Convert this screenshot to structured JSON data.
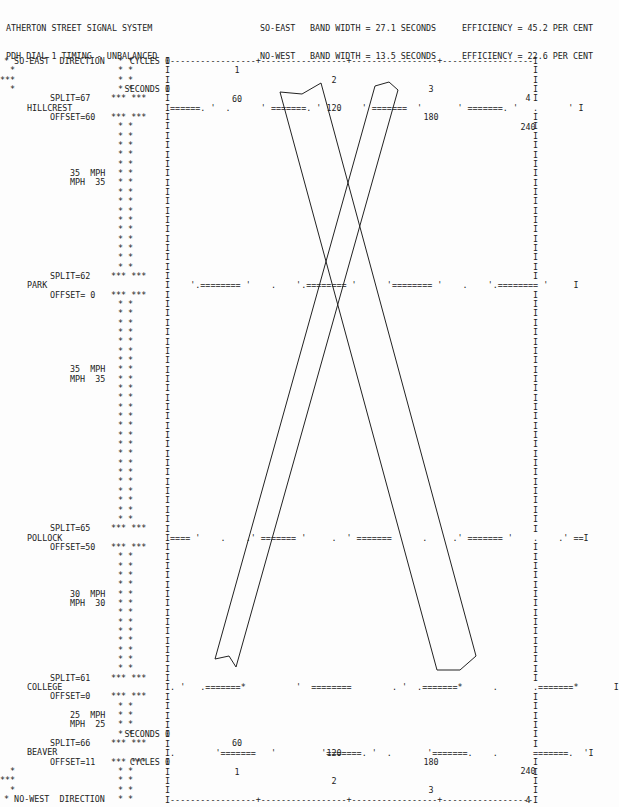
{
  "header": {
    "title_line1": "ATHERTON STREET SIGNAL SYSTEM",
    "title_line2": "PDH DIAL 1 TIMING - UNBALANCED",
    "so_east": {
      "direction": "SO-EAST",
      "band": "BAND WIDTH = 27.1 SECONDS",
      "efficiency": "EFFICIENCY = 45.2 PER CENT"
    },
    "no_west": {
      "direction": "NO-WEST",
      "band": "BAND WIDTH = 13.5 SECONDS",
      "efficiency": "EFFICIENCY = 22.6 PER CENT"
    }
  },
  "axis": {
    "cycles_label": "CYCLES 0",
    "seconds_label": "SECONDS 0",
    "cycles": [
      "1",
      "2",
      "3",
      "4"
    ],
    "seconds": [
      "60",
      "120",
      "180",
      "240"
    ]
  },
  "directions": {
    "top": "* SO-EAST  DIRECTION",
    "bottom": "* NO-WEST  DIRECTION"
  },
  "intersections": [
    {
      "name": "HILLCREST",
      "split": "SPLIT=67",
      "offset": "OFFSET=60",
      "pattern": "I======. '  .      ' =======. '   .    ' =======  '       ' =======. '   .      ' I"
    },
    {
      "name": "PARK",
      "split": "SPLIT=62",
      "offset": "OFFSET= 0",
      "pattern": "I    '.======== '    .    '.======== '      '======== '    .    '.======== '     I"
    },
    {
      "name": "POLLOCK",
      "split": "SPLIT=65",
      "offset": "OFFSET=50",
      "pattern": "I==== '    .    .' ======= '     .  ' =======      .     .' ======= '    .    .' ==I"
    },
    {
      "name": "COLLEGE",
      "split": "SPLIT=61",
      "offset": "OFFSET=0",
      "pattern": "I. '   .=======*          '  ========        . '  .=======*      .       .=======*       I"
    },
    {
      "name": "BEAVER",
      "split": "SPLIT=66",
      "offset": "OFFSET=11",
      "pattern": "I.        '=======   '         '=======. '  .       '=======.    .       =======.  'I"
    }
  ],
  "speeds": [
    {
      "se": "35  MPH",
      "nw": "MPH  35"
    },
    {
      "se": "35  MPH",
      "nw": "MPH  35"
    },
    {
      "se": "30  MPH",
      "nw": "MPH  30"
    },
    {
      "se": "25  MPH",
      "nw": "MPH  25"
    }
  ],
  "bands": {
    "so_east_color": "#222222",
    "no_west_color": "#222222"
  }
}
